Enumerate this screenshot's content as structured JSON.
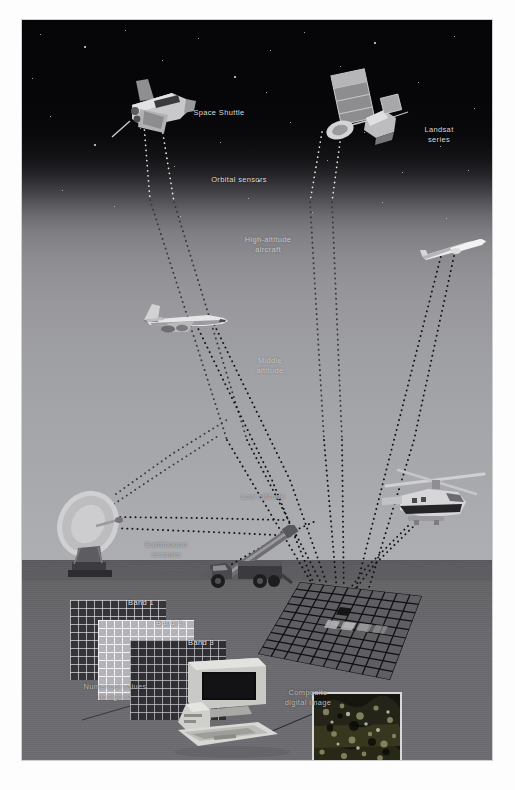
{
  "figure": {
    "frame_border_color": "#cfcfcf",
    "background_color": "#ffffff"
  },
  "sky": {
    "space_color": "#050507",
    "horizon_color": "#adaeb1"
  },
  "ground": {
    "color": "#6a6a6e"
  },
  "labels": {
    "space_shuttle": "Space Shuttle",
    "landsat_series": "Landsat\nseries",
    "orbital_sensors": "Orbital sensors",
    "high_altitude_aircraft": "High-altitude\naircraft",
    "middle_altitude": "Middle\naltitude",
    "low_altitude": "Low altitude",
    "earthbound_sensors": "Earthbound\nsensors",
    "band_1": "Band 1",
    "band_2": "Band 2",
    "band_3": "Band 3",
    "numerical_values_assigned": "Numerical values\nassigned",
    "composite_digital_image": "Composite\ndigital image"
  },
  "platforms": [
    {
      "name": "space-shuttle",
      "altitude_tier": "orbital",
      "label": "Space Shuttle"
    },
    {
      "name": "landsat",
      "altitude_tier": "orbital",
      "label": "Landsat series"
    },
    {
      "name": "jet-aircraft",
      "altitude_tier": "high",
      "label": "High-altitude aircraft"
    },
    {
      "name": "glider",
      "altitude_tier": "middle",
      "label": "Middle altitude"
    },
    {
      "name": "helicopter",
      "altitude_tier": "low",
      "label": "Low altitude"
    },
    {
      "name": "satellite-dish",
      "altitude_tier": "earthbound",
      "label": "Earthbound sensors"
    },
    {
      "name": "boom-truck",
      "altitude_tier": "earthbound",
      "label": "Earthbound sensors"
    }
  ],
  "bands": [
    {
      "label": "Band 1",
      "fill": "#35353a",
      "line": "#d7d7dc"
    },
    {
      "label": "Band 2",
      "fill": "#b4b4b8",
      "line": "#f5f5f8"
    },
    {
      "label": "Band 3",
      "fill": "#2f2f34",
      "line": "#cdcdd2"
    }
  ],
  "colors": {
    "label_text": "#d9d9d9",
    "ray_dots": "#1a1a1a",
    "ray_dots_light": "#e8e8e8",
    "grid_line": "#121214"
  }
}
